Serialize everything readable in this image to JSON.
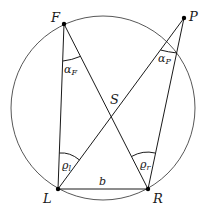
{
  "diagram": {
    "type": "geometry-circle-inscribed-angles",
    "points": {
      "F": {
        "label": "F",
        "x": 64,
        "y": 24
      },
      "P": {
        "label": "P",
        "x": 184,
        "y": 18
      },
      "L": {
        "label": "L",
        "x": 58,
        "y": 189
      },
      "R": {
        "label": "R",
        "x": 148,
        "y": 189
      },
      "S": {
        "label": "S"
      }
    },
    "circle": {
      "cx": 103,
      "cy": 108,
      "r": 92
    },
    "segments": [
      {
        "from": "F",
        "to": "L"
      },
      {
        "from": "F",
        "to": "R"
      },
      {
        "from": "P",
        "to": "L"
      },
      {
        "from": "P",
        "to": "R"
      },
      {
        "from": "L",
        "to": "R",
        "label": "b"
      }
    ],
    "angles": {
      "alpha_F": {
        "base": "α",
        "sub": "F"
      },
      "alpha_P": {
        "base": "α",
        "sub": "P"
      },
      "rho_l": {
        "base": "ϱ",
        "sub": "l"
      },
      "rho_r": {
        "base": "ϱ",
        "sub": "r"
      }
    },
    "baseline_label": "b",
    "colors": {
      "stroke": "#1a1a1a",
      "circle": "#444444"
    }
  }
}
